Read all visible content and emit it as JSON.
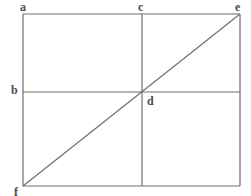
{
  "figure": {
    "background_color": "#ffffff",
    "stroke_color": "#6e6e6e",
    "label_color": "#4a4a4a",
    "stroke_width": 1.2
  },
  "labels": {
    "a": "a",
    "b": "b",
    "c": "c",
    "d": "d",
    "e": "e",
    "f": "f"
  },
  "chart_data": {
    "type": "diagram",
    "xlabel": "",
    "ylabel": "",
    "xlim": [
      0,
      251
    ],
    "ylim": [
      0,
      196
    ],
    "grid": false,
    "legend": "none",
    "points": [
      {
        "name": "a",
        "label": "a",
        "x": 23,
        "y": 14,
        "role": "top-left-corner"
      },
      {
        "name": "c",
        "label": "c",
        "x": 142,
        "y": 14,
        "role": "top-midpoint"
      },
      {
        "name": "e",
        "label": "e",
        "x": 240,
        "y": 14,
        "role": "top-right-corner"
      },
      {
        "name": "b",
        "label": "b",
        "x": 23,
        "y": 92,
        "role": "left-midpoint"
      },
      {
        "name": "d",
        "label": "d",
        "x": 142,
        "y": 92,
        "role": "center-intersection"
      },
      {
        "name": "f",
        "label": "f",
        "x": 23,
        "y": 186,
        "role": "bottom-left-corner"
      }
    ],
    "segments": [
      {
        "name": "rectangle-top",
        "x1": 23,
        "y1": 14,
        "x2": 240,
        "y2": 14
      },
      {
        "name": "rectangle-right",
        "x1": 240,
        "y1": 14,
        "x2": 240,
        "y2": 186
      },
      {
        "name": "rectangle-bottom",
        "x1": 23,
        "y1": 186,
        "x2": 240,
        "y2": 186
      },
      {
        "name": "rectangle-left",
        "x1": 23,
        "y1": 14,
        "x2": 23,
        "y2": 186
      },
      {
        "name": "vertical-median-cd",
        "x1": 142,
        "y1": 14,
        "x2": 142,
        "y2": 186
      },
      {
        "name": "horizontal-median-bd",
        "x1": 23,
        "y1": 92,
        "x2": 240,
        "y2": 92
      },
      {
        "name": "diagonal-fe",
        "x1": 23,
        "y1": 186,
        "x2": 240,
        "y2": 14
      }
    ]
  }
}
